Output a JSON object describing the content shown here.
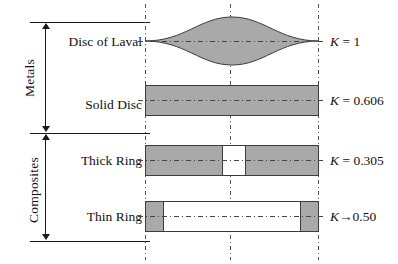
{
  "diagram": {
    "groups": [
      {
        "name": "metals-group",
        "label": "Metals"
      },
      {
        "name": "composites-group",
        "label": "Composites"
      }
    ],
    "rows": [
      {
        "name": "disc-of-laval",
        "label": "Disc of Laval",
        "k_symbol": "K",
        "k_relation": " = ",
        "k_value": "1",
        "shape": "lens"
      },
      {
        "name": "solid-disc",
        "label": "Solid Disc",
        "k_symbol": "K",
        "k_relation": " = ",
        "k_value": "0.606",
        "shape": "solid-bar"
      },
      {
        "name": "thick-ring",
        "label": "Thick Ring",
        "k_symbol": "K",
        "k_relation": " = ",
        "k_value": "0.305",
        "shape": "bar-center-gap"
      },
      {
        "name": "thin-ring",
        "label": "Thin Ring",
        "k_symbol": "K",
        "k_relation": "→",
        "k_value": "0.50",
        "shape": "bar-ends-only"
      }
    ],
    "colors": {
      "fill_gray": "#a9a9a9",
      "outline": "#3c3c3c",
      "rule": "#1a1a1a",
      "background": "#ffffff",
      "dash_line": "#555555"
    }
  }
}
